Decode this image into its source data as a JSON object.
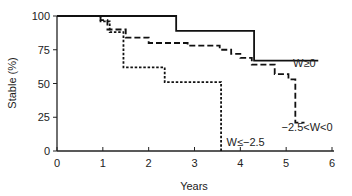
{
  "chart_data": {
    "type": "line",
    "subtype": "kaplan-meier step",
    "title": "",
    "xlabel": "Years",
    "ylabel": "Stable (%)",
    "xlim": [
      0,
      6
    ],
    "ylim": [
      0,
      100
    ],
    "xticks": [
      0,
      1,
      2,
      3,
      4,
      5,
      6
    ],
    "yticks": [
      0,
      25,
      50,
      75,
      100
    ],
    "grid": false,
    "series": [
      {
        "name": "W≥0",
        "style": "solid",
        "steps": [
          [
            0,
            100
          ],
          [
            2.6,
            89
          ],
          [
            4.3,
            67
          ],
          [
            5.7,
            67
          ]
        ]
      },
      {
        "name": "−2.5<W<0",
        "style": "dashed",
        "steps": [
          [
            0,
            100
          ],
          [
            0.95,
            97
          ],
          [
            1.1,
            90
          ],
          [
            1.5,
            84
          ],
          [
            2.0,
            80
          ],
          [
            2.85,
            78
          ],
          [
            3.55,
            75
          ],
          [
            3.8,
            72
          ],
          [
            4.0,
            69
          ],
          [
            4.25,
            64
          ],
          [
            4.75,
            57
          ],
          [
            5.05,
            53
          ],
          [
            5.2,
            21
          ],
          [
            5.4,
            21
          ]
        ]
      },
      {
        "name": "W≤−2.5",
        "style": "dotted",
        "steps": [
          [
            0,
            100
          ],
          [
            0.95,
            96
          ],
          [
            1.15,
            88
          ],
          [
            1.45,
            62
          ],
          [
            2.35,
            51
          ],
          [
            3.58,
            0
          ]
        ]
      }
    ],
    "annotations": [
      {
        "text": "W≥0",
        "x": 5.15,
        "y": 62
      },
      {
        "text": "−2.5<W<0",
        "x": 4.9,
        "y": 15
      },
      {
        "text": "W≤−2.5",
        "x": 3.7,
        "y": 4
      }
    ]
  }
}
